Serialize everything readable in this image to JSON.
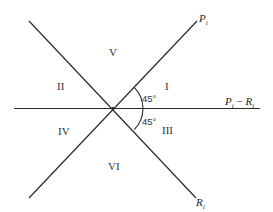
{
  "diagram": {
    "axes": {
      "p_label": "P",
      "p_sub": "i",
      "r_label": "R",
      "r_sub": "i",
      "diff_p": "P",
      "diff_p_sub": "i",
      "diff_minus": " − ",
      "diff_r": "R",
      "diff_r_sub": "i"
    },
    "regions": {
      "I": "I",
      "II": "II",
      "III": "III",
      "IV": "IV",
      "V": "V",
      "VI": "VI"
    },
    "angles": {
      "upper": "45°",
      "lower": "45°"
    },
    "colors": {
      "line": "#2a2a2a",
      "text": "#333333",
      "background": "#ffffff"
    }
  }
}
